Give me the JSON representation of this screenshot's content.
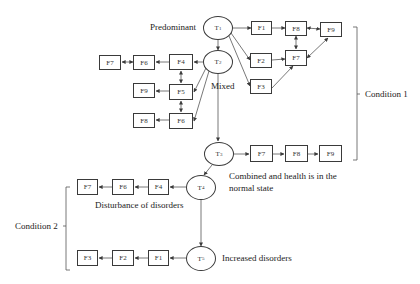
{
  "diagram": {
    "labels": {
      "predominant": "Predominant",
      "mixed": "Mixed",
      "combined_line1": "Combined  and health is in the",
      "combined_line2": "normal state",
      "disturbance": "Disturbance of disorders",
      "increased": "Increased disorders",
      "condition1": "Condition 1",
      "condition2": "Condition 2"
    },
    "nodes": {
      "t1": {
        "base": "T",
        "sub": "1"
      },
      "t2": {
        "base": "T",
        "sub": "2"
      },
      "t3": {
        "base": "T",
        "sub": "3"
      },
      "t4": {
        "base": "T",
        "sub": "4"
      },
      "t5": {
        "base": "T",
        "sub": "5"
      }
    },
    "boxes": {
      "t1_f1": "F1",
      "t1_f2": "F2",
      "t1_f3": "F3",
      "t1_f8": "F8",
      "t1_f7": "F7",
      "t1_f9": "F9",
      "t2_f4": "F4",
      "t2_f5": "F5",
      "t2_f6": "F6",
      "t2_f6b": "F6",
      "t2_f7": "F7",
      "t2_f9": "F9",
      "t2_f8": "F8",
      "t3_f7": "F7",
      "t3_f8": "F8",
      "t3_f9": "F9",
      "t4_f4": "F4",
      "t4_f6": "F6",
      "t4_f7": "F7",
      "t5_f1": "F1",
      "t5_f2": "F2",
      "t5_f3": "F3"
    },
    "edges": [
      {
        "from": "T1",
        "to": "T2"
      },
      {
        "from": "T1",
        "to": "F1"
      },
      {
        "from": "T1",
        "to": "F2"
      },
      {
        "from": "T1",
        "to": "F3"
      },
      {
        "from": "F1",
        "to": "F8"
      },
      {
        "from": "F2",
        "to": "F7"
      },
      {
        "from": "F3",
        "to": "F7"
      },
      {
        "from": "F8",
        "to": "F7",
        "bidirectional": true
      },
      {
        "from": "F8",
        "to": "F9",
        "bidirectional": true
      },
      {
        "from": "F7",
        "to": "F9",
        "bidirectional": true
      },
      {
        "from": "T2",
        "to": "F4"
      },
      {
        "from": "T2",
        "to": "F5"
      },
      {
        "from": "T2",
        "to": "F6"
      },
      {
        "from": "T2",
        "to": "T3"
      },
      {
        "from": "F4",
        "to": "F6"
      },
      {
        "from": "F6",
        "to": "F7",
        "bidirectional": true
      },
      {
        "from": "F4",
        "to": "F5",
        "bidirectional": true
      },
      {
        "from": "F5",
        "to": "F6",
        "bidirectional": true
      },
      {
        "from": "F5",
        "to": "F9"
      },
      {
        "from": "F6",
        "to": "F8"
      },
      {
        "from": "T3",
        "to": "F7"
      },
      {
        "from": "F7",
        "to": "F8"
      },
      {
        "from": "F8",
        "to": "F9"
      },
      {
        "from": "T3",
        "to": "T4"
      },
      {
        "from": "T4",
        "to": "F4"
      },
      {
        "from": "F4",
        "to": "F6"
      },
      {
        "from": "F6",
        "to": "F7"
      },
      {
        "from": "T4",
        "to": "T5"
      },
      {
        "from": "T5",
        "to": "F1"
      },
      {
        "from": "F1",
        "to": "F2"
      },
      {
        "from": "F2",
        "to": "F3"
      }
    ]
  }
}
